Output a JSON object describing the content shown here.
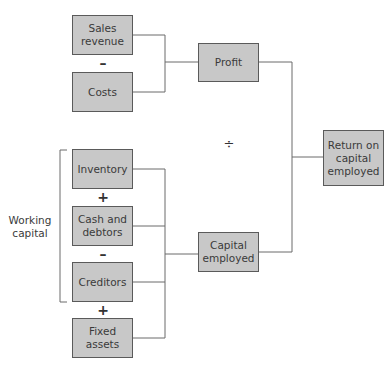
{
  "diagram": {
    "nodes": {
      "sales_revenue": "Sales revenue",
      "costs": "Costs",
      "profit": "Profit",
      "roce": "Return on capital employed",
      "inventory": "Inventory",
      "cash_debtors": "Cash and debtors",
      "creditors": "Creditors",
      "fixed_assets": "Fixed assets",
      "capital_employed": "Capital employed"
    },
    "operators": {
      "minus_1": "–",
      "divide": "÷",
      "plus_1": "+",
      "minus_2": "–",
      "plus_2": "+"
    },
    "group_label": "Working capital",
    "colors": {
      "box_fill": "#c8c8c8",
      "box_border": "#5a5a5a",
      "line": "#6a6a6a"
    }
  }
}
